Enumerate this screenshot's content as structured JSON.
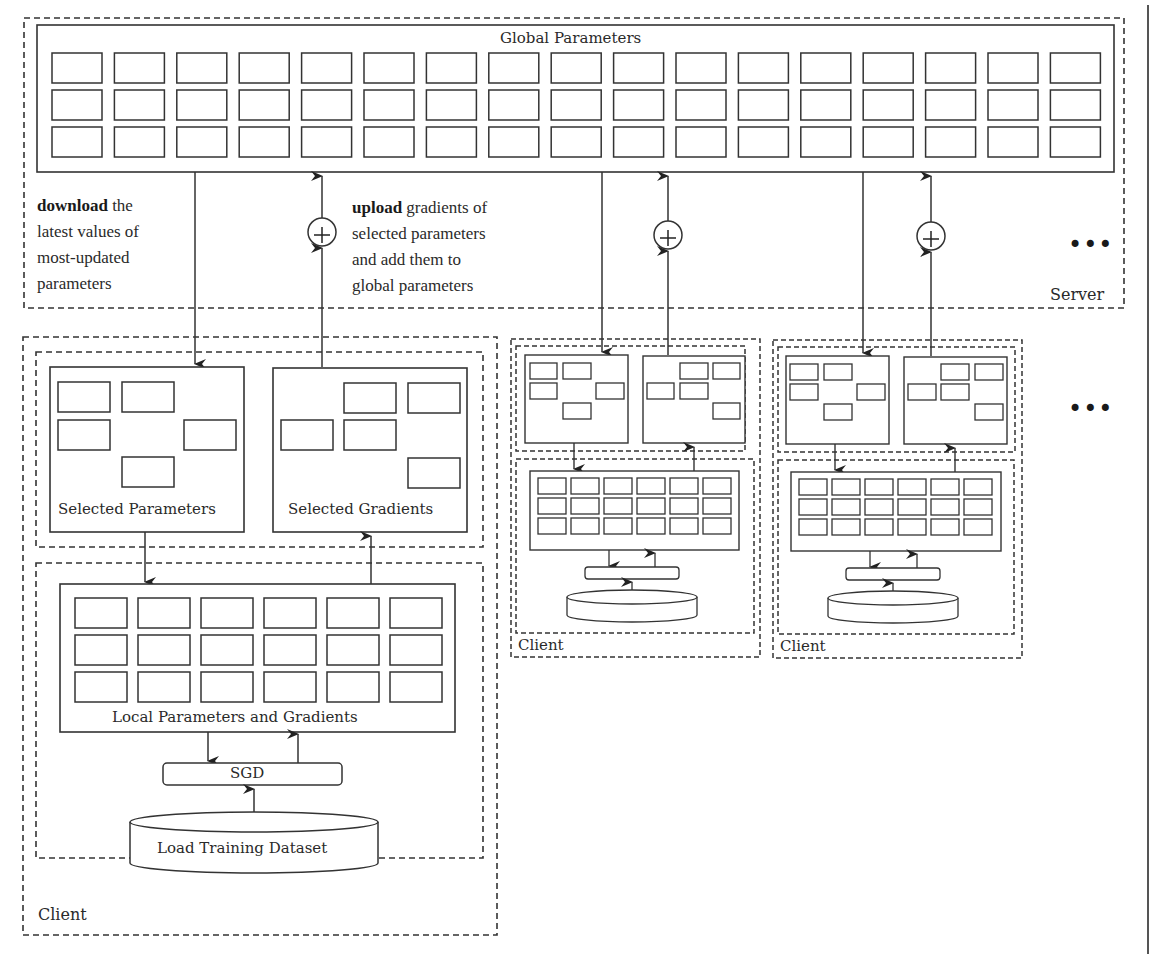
{
  "colors": {
    "line": "#333333",
    "dash": "#333333",
    "text": "#2a2a2a",
    "background": "#ffffff"
  },
  "server": {
    "label": "Server",
    "global_parameters": {
      "title": "Global Parameters",
      "rows": 3,
      "cols": 17
    },
    "download_note": {
      "bold": "download",
      "line1_rest": " the",
      "line2": "latest values of",
      "line3": "most-updated",
      "line4": "parameters"
    },
    "upload_note": {
      "bold": "upload",
      "line1_rest": " gradients of",
      "line2": "selected parameters",
      "line3": "and add them to",
      "line4": "global parameters"
    },
    "aggregate_symbol": "+",
    "more_clients_symbol": "•••"
  },
  "clients": [
    {
      "label": "Client",
      "selected_parameters_label": "Selected Parameters",
      "selected_gradients_label": "Selected Gradients",
      "local_label": "Local Parameters and Gradients",
      "local_grid": {
        "rows": 3,
        "cols": 6
      },
      "optimizer_label": "SGD",
      "dataset_label": "Load Training Dataset"
    },
    {
      "label": "Client",
      "local_grid": {
        "rows": 3,
        "cols": 6
      }
    },
    {
      "label": "Client",
      "local_grid": {
        "rows": 3,
        "cols": 6
      }
    }
  ],
  "more_clients_symbol": "•••"
}
